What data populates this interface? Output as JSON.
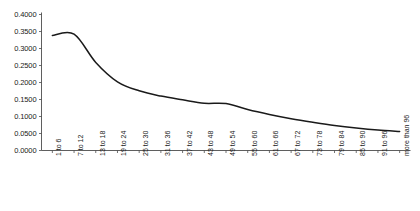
{
  "chart_data": {
    "type": "line",
    "title": "",
    "subtitle": "",
    "xlabel": "",
    "ylabel": "",
    "grid": false,
    "legend": false,
    "legend_position": "none",
    "ylim": [
      0.0,
      0.4
    ],
    "ytick_labels": [
      "0.4000",
      "0.3500",
      "0.3000",
      "0.2500",
      "0.2000",
      "0.1500",
      "0.1000",
      "0.0500",
      "0.0000"
    ],
    "ytick_values": [
      0.4,
      0.35,
      0.3,
      0.25,
      0.2,
      0.15,
      0.1,
      0.05,
      0.0
    ],
    "categories": [
      "1 to 6",
      "7 to 12",
      "13 to 18",
      "19 to 24",
      "25 to 30",
      "31 to 36",
      "37 to 42",
      "43 to 48",
      "49 to 54",
      "55 to 60",
      "61 to 66",
      "67 to 72",
      "73 to 78",
      "79 to 84",
      "85 to 90",
      "91 to 96",
      "more than 96"
    ],
    "values": [
      0.3385,
      0.342,
      0.259,
      0.202,
      0.1755,
      0.16,
      0.149,
      0.139,
      0.138,
      0.1205,
      0.106,
      0.0935,
      0.083,
      0.0735,
      0.066,
      0.06,
      0.056
    ],
    "series": [
      {
        "name": "",
        "color": "#1a1a1a",
        "values": [
          0.3385,
          0.342,
          0.259,
          0.202,
          0.1755,
          0.16,
          0.149,
          0.139,
          0.138,
          0.1205,
          0.106,
          0.0935,
          0.083,
          0.0735,
          0.066,
          0.06,
          0.056
        ]
      }
    ],
    "axis_color": "#4d4d4d",
    "line_color": "#1a1a1a",
    "background": "#ffffff"
  }
}
